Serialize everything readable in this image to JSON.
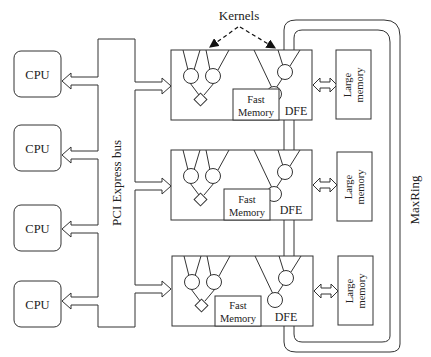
{
  "diagram": {
    "title_label": "Kernels",
    "bus_label": "PCI Express bus",
    "ring_label": "MaxRing",
    "cpus": [
      {
        "label": "CPU"
      },
      {
        "label": "CPU"
      },
      {
        "label": "CPU"
      },
      {
        "label": "CPU"
      }
    ],
    "dfes": [
      {
        "label": "DFE",
        "fast_memory_line1": "Fast",
        "fast_memory_line2": "Memory",
        "large_memory_line1": "Large",
        "large_memory_line2": "memory"
      },
      {
        "label": "DFE",
        "fast_memory_line1": "Fast",
        "fast_memory_line2": "Memory",
        "large_memory_line1": "Large",
        "large_memory_line2": "memory"
      },
      {
        "label": "DFE",
        "fast_memory_line1": "Fast",
        "fast_memory_line2": "Memory",
        "large_memory_line1": "Large",
        "large_memory_line2": "memory"
      }
    ],
    "colors": {
      "stroke": "#333333",
      "background": "#ffffff"
    }
  }
}
